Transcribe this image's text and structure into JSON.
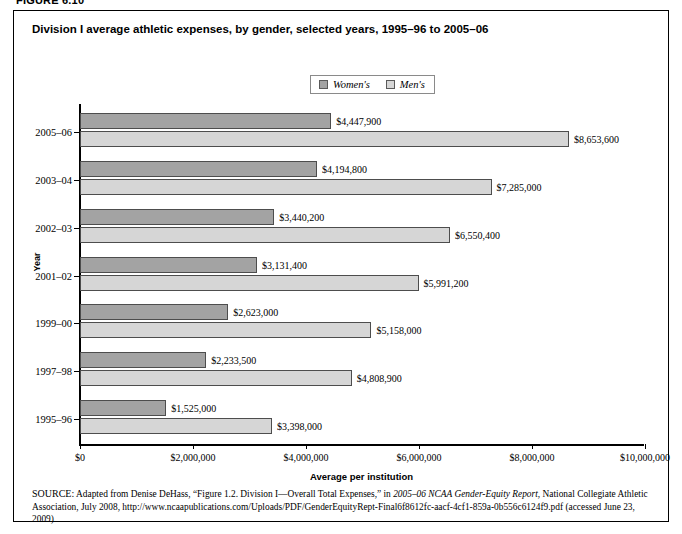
{
  "figure_label": "FIGURE 6.10",
  "chart_title": "Division I average athletic expenses, by gender, selected years, 1995–96 to 2005–06",
  "legend": {
    "entries": [
      {
        "label": "Women's",
        "color": "#a3a3a3",
        "name": "legend-women"
      },
      {
        "label": "Men's",
        "color": "#d6d6d6",
        "name": "legend-men"
      }
    ]
  },
  "axes": {
    "y_title": "Year",
    "x_title": "Average per institution",
    "x_ticks": [
      "$0",
      "$2,000,000",
      "$4,000,000",
      "$6,000,000",
      "$8,000,000",
      "$10,000,000"
    ]
  },
  "source": {
    "prefix": "SOURCE:",
    "line": " Adapted from Denise DeHass, “Figure 1.2. Division I—Overall Total Expenses,” in ",
    "italic_title": "2005–06 NCAA Gender-Equity Report",
    "rest": ", National Collegiate Athletic Association, July 2008, http://www.ncaapublications.com/Uploads/PDF/GenderEquityRept-Final6f8612fc-aacf-4cf1-859a-0b556c6124f9.pdf (accessed June 23, 2009)"
  },
  "chart_data": {
    "type": "bar",
    "orientation": "horizontal",
    "title": "Division I average athletic expenses, by gender, selected years, 1995–96 to 2005–06",
    "xlabel": "Average per institution",
    "ylabel": "Year",
    "xlim": [
      0,
      10000000
    ],
    "xticks": [
      0,
      2000000,
      4000000,
      6000000,
      8000000,
      10000000
    ],
    "xtick_labels": [
      "$0",
      "$2,000,000",
      "$4,000,000",
      "$6,000,000",
      "$8,000,000",
      "$10,000,000"
    ],
    "grid": false,
    "legend_position": "top-center",
    "categories": [
      "2005–06",
      "2003–04",
      "2002–03",
      "2001–02",
      "1999–00",
      "1997–98",
      "1995–96"
    ],
    "series": [
      {
        "name": "Women's",
        "color": "#a3a3a3",
        "values": [
          4447900,
          4194800,
          3440200,
          3131400,
          2623000,
          2233500,
          1525000
        ],
        "labels": [
          "$4,447,900",
          "$4,194,800",
          "$3,440,200",
          "$3,131,400",
          "$2,623,000",
          "$2,233,500",
          "$1,525,000"
        ]
      },
      {
        "name": "Men's",
        "color": "#d6d6d6",
        "values": [
          8653600,
          7285000,
          6550400,
          5991200,
          5158000,
          4808900,
          3398000
        ],
        "labels": [
          "$8,653,600",
          "$7,285,000",
          "$6,550,400",
          "$5,991,200",
          "$5,158,000",
          "$4,808,900",
          "$3,398,000"
        ]
      }
    ]
  }
}
